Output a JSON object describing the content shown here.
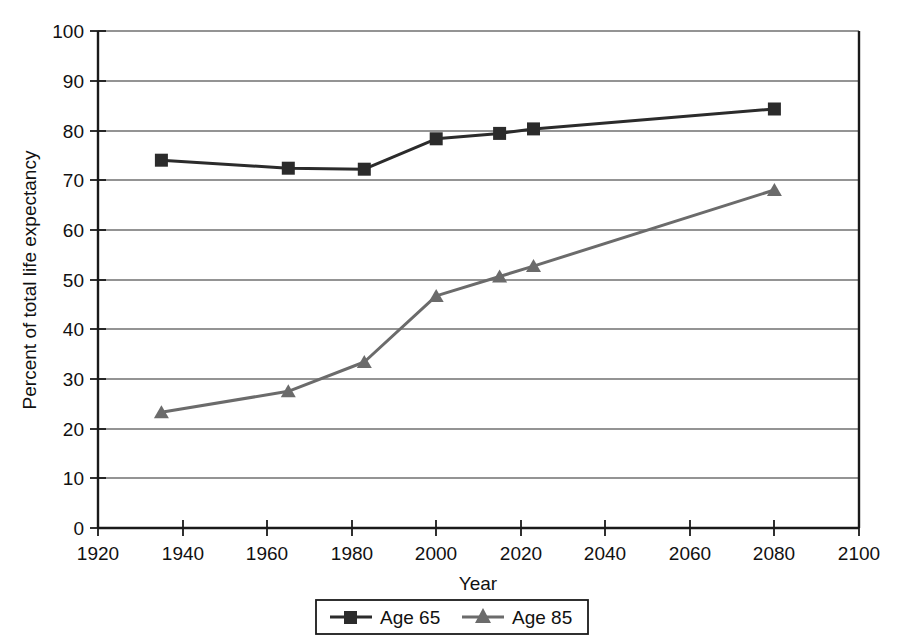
{
  "chart_data": {
    "type": "line",
    "title": "",
    "xlabel": "Year",
    "ylabel": "Percent of total life expectancy",
    "xlim": [
      1920,
      2100
    ],
    "ylim": [
      0,
      100
    ],
    "xticks": [
      1920,
      1940,
      1960,
      1980,
      2000,
      2020,
      2040,
      2060,
      2080,
      2100
    ],
    "yticks": [
      0,
      10,
      20,
      30,
      40,
      50,
      60,
      70,
      80,
      90,
      100
    ],
    "xtick_labels": [
      "1920",
      "1940",
      "1960",
      "1980",
      "2000",
      "2020",
      "2040",
      "2060",
      "2080",
      "2100"
    ],
    "ytick_labels": [
      "0",
      "10",
      "20",
      "30",
      "40",
      "50",
      "60",
      "70",
      "80",
      "90",
      "100"
    ],
    "grid": "horizontal",
    "legend_position": "bottom",
    "series": [
      {
        "name": "Age 65",
        "marker": "square",
        "color": "#2b2b2b",
        "x": [
          1935,
          1965,
          1983,
          2000,
          2015,
          2023,
          2080
        ],
        "values": [
          74.0,
          72.4,
          72.2,
          78.3,
          79.4,
          80.3,
          84.3
        ]
      },
      {
        "name": "Age 85",
        "marker": "triangle",
        "color": "#6b6b6b",
        "x": [
          1935,
          1965,
          1983,
          2000,
          2015,
          2023,
          2080
        ],
        "values": [
          23.3,
          27.5,
          33.4,
          46.7,
          50.6,
          52.7,
          68.0
        ]
      }
    ]
  },
  "legend": {
    "entries": [
      {
        "label": "Age 65"
      },
      {
        "label": "Age 85"
      }
    ]
  },
  "colors": {
    "series_age_65": "#2b2b2b",
    "series_age_85": "#6b6b6b",
    "axis": "#1a1a1a",
    "grid": "#2b2b2b",
    "background": "#ffffff"
  }
}
